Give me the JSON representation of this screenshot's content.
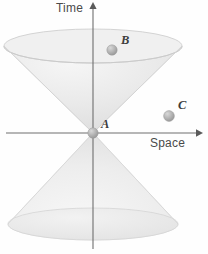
{
  "figure": {
    "axes": {
      "vertical": {
        "name": "time-axis",
        "label": "Time",
        "arrow": "up"
      },
      "horizontal": {
        "name": "space-axis",
        "label": "Space",
        "arrow": "right"
      }
    },
    "events": [
      {
        "id": "A",
        "label": "A",
        "x": 93,
        "y": 133,
        "radius": 5.2,
        "location": "origin-apex"
      },
      {
        "id": "B",
        "label": "B",
        "x": 112,
        "y": 50,
        "radius": 5.2,
        "location": "inside-future-cone"
      },
      {
        "id": "C",
        "label": "C",
        "x": 169,
        "y": 116,
        "radius": 5.4,
        "location": "outside-cone"
      }
    ],
    "cones": [
      {
        "id": "future-cone",
        "apex_x": 93,
        "apex_y": 133,
        "rim_cy": 46,
        "rim_rx": 89,
        "rim_ry": 17
      },
      {
        "id": "past-cone",
        "apex_x": 93,
        "apex_y": 133,
        "rim_cy": 224,
        "rim_rx": 85,
        "rim_ry": 16
      }
    ],
    "colors": {
      "background": "#fefefe",
      "axis": "#6e6e6e",
      "cone_fill": "#ebebeb",
      "cone_edge": "#d2d2d2",
      "sphere": "#b4b4b4",
      "label_text": "#4a4a4a",
      "event_text": "#3d3d3d"
    }
  }
}
